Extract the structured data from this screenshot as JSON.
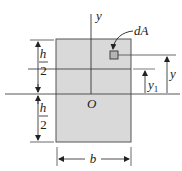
{
  "diagram": {
    "labels": {
      "y_axis": "y",
      "dA": "dA",
      "h_top_num": "h",
      "h_top_den": "2",
      "h_bottom_num": "h",
      "h_bottom_den": "2",
      "origin": "O",
      "y_dim": "y",
      "y1_base": "y",
      "y1_sub": "1",
      "b": "b"
    },
    "colors": {
      "fill": "#d9d9d9",
      "stroke": "#555555",
      "line": "#333333"
    }
  }
}
